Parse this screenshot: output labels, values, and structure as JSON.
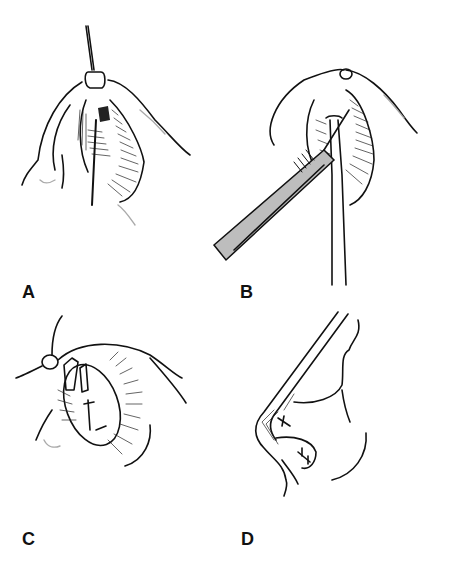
{
  "figure": {
    "panels": [
      {
        "id": "A",
        "label": "A",
        "description": "Nasal ala retracted; instrument inserted through nostril with retractor at rim"
      },
      {
        "id": "B",
        "label": "B",
        "description": "Scalpel incision at nostril rim with forceps holding tissue"
      },
      {
        "id": "C",
        "label": "C",
        "description": "Nostril with sutured cartilage graft, oblique view"
      },
      {
        "id": "D",
        "label": "D",
        "description": "Lateral profile of nose showing graft and sutures at tip"
      }
    ],
    "colors": {
      "line": "#111111",
      "shading": "#999999",
      "background": "#ffffff"
    }
  }
}
